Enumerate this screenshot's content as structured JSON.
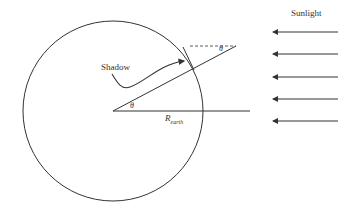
{
  "diagram": {
    "labels": {
      "sunlight": "Sunlight",
      "shadow": "Shadow",
      "theta_center": "θ",
      "theta_top": "θ",
      "radius_main": "R",
      "radius_sub": "earth"
    },
    "colors": {
      "stroke": "#333333",
      "background": "#ffffff"
    },
    "earth_circle": {
      "cx": 113,
      "cy": 111,
      "r": 90
    },
    "radius_lines": [
      {
        "name": "horizontal-radius",
        "from": [
          113,
          111
        ],
        "to": [
          250,
          111
        ]
      },
      {
        "name": "angled-radius",
        "from": [
          113,
          111
        ],
        "to": [
          236,
          46
        ]
      }
    ],
    "dashed_reference": {
      "from": [
        190,
        46
      ],
      "to": [
        236,
        46
      ]
    },
    "sunlight_arrows": [
      {
        "y": 32,
        "x_start": 338,
        "x_end": 271
      },
      {
        "y": 54,
        "x_start": 338,
        "x_end": 271
      },
      {
        "y": 77,
        "x_start": 338,
        "x_end": 271
      },
      {
        "y": 99,
        "x_start": 338,
        "x_end": 271
      },
      {
        "y": 121,
        "x_start": 338,
        "x_end": 271
      }
    ]
  }
}
